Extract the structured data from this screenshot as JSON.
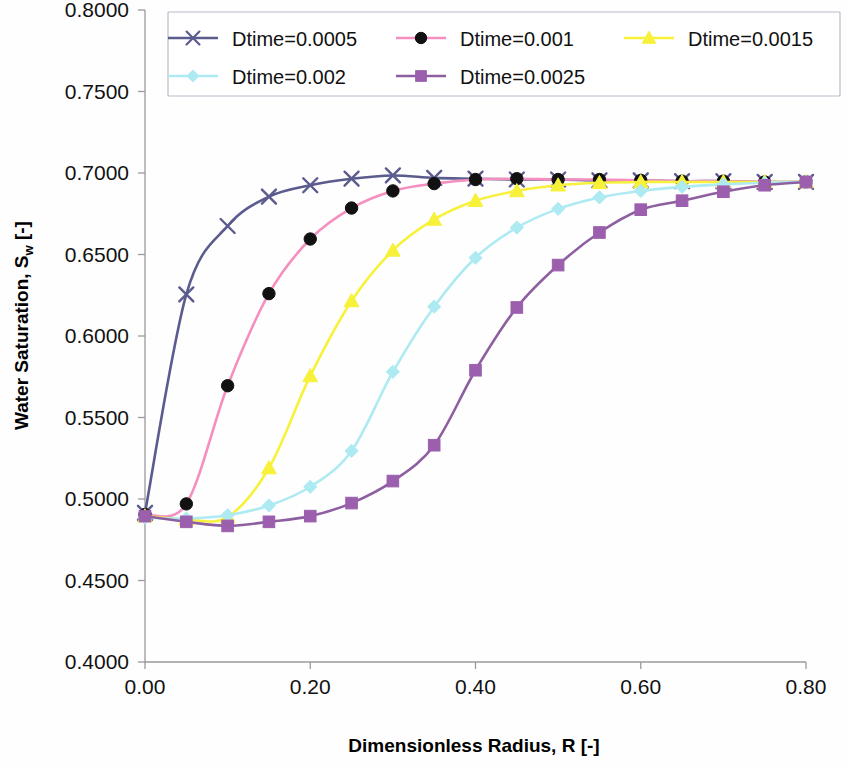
{
  "chart_data": {
    "type": "line",
    "title": "",
    "xlabel": "Dimensionless Radius, R [-]",
    "ylabel_main": "Water Saturation, S",
    "ylabel_sub": "w",
    "ylabel_tail": " [-]",
    "xlim": [
      0.0,
      0.8
    ],
    "ylim": [
      0.4,
      0.8
    ],
    "grid": false,
    "legend_position": "top",
    "xticks": [
      "0.00",
      "0.20",
      "0.40",
      "0.60",
      "0.80"
    ],
    "xtick_values": [
      0.0,
      0.2,
      0.4,
      0.6,
      0.8
    ],
    "yticks": [
      "0.4000",
      "0.4500",
      "0.5000",
      "0.5500",
      "0.6000",
      "0.6500",
      "0.7000",
      "0.7500",
      "0.8000"
    ],
    "ytick_values": [
      0.4,
      0.45,
      0.5,
      0.55,
      0.6,
      0.65,
      0.7,
      0.75,
      0.8
    ],
    "x": [
      0.0,
      0.05,
      0.1,
      0.15,
      0.2,
      0.25,
      0.3,
      0.35,
      0.4,
      0.45,
      0.5,
      0.55,
      0.6,
      0.65,
      0.7,
      0.75,
      0.8
    ],
    "series": [
      {
        "name": "Dtime=0.0005",
        "color": "#5b5b8e",
        "marker": "x",
        "marker_color": "#5b5b8e",
        "values": [
          0.4915,
          0.6255,
          0.6675,
          0.6855,
          0.6925,
          0.6965,
          0.6985,
          0.697,
          0.6965,
          0.696,
          0.696,
          0.6955,
          0.6955,
          0.695,
          0.695,
          0.6945,
          0.6945
        ]
      },
      {
        "name": "Dtime=0.001",
        "color": "#f48fc0",
        "marker": "circle",
        "marker_color": "#111111",
        "values": [
          0.4905,
          0.497,
          0.5695,
          0.626,
          0.6595,
          0.6785,
          0.689,
          0.6935,
          0.696,
          0.6965,
          0.696,
          0.696,
          0.6955,
          0.695,
          0.695,
          0.6945,
          0.6945
        ]
      },
      {
        "name": "Dtime=0.0015",
        "color": "#f8f13a",
        "marker": "triangle",
        "marker_color": "#f8f13a",
        "values": [
          0.4895,
          0.4875,
          0.489,
          0.519,
          0.5755,
          0.6215,
          0.6525,
          0.6715,
          0.683,
          0.689,
          0.6925,
          0.694,
          0.6945,
          0.6945,
          0.6945,
          0.6945,
          0.6945
        ]
      },
      {
        "name": "Dtime=0.002",
        "color": "#aeeaf2",
        "marker": "diamond",
        "marker_color": "#aeeaf2",
        "values": [
          0.4885,
          0.488,
          0.49,
          0.496,
          0.5075,
          0.5295,
          0.578,
          0.618,
          0.648,
          0.6665,
          0.678,
          0.685,
          0.689,
          0.6915,
          0.693,
          0.694,
          0.6945
        ]
      },
      {
        "name": "Dtime=0.0025",
        "color": "#8e5fa0",
        "marker": "square",
        "marker_color": "#9b5fae",
        "values": [
          0.4895,
          0.486,
          0.4835,
          0.486,
          0.4895,
          0.4975,
          0.511,
          0.533,
          0.579,
          0.6175,
          0.6435,
          0.6635,
          0.6775,
          0.683,
          0.6885,
          0.6925,
          0.6945
        ]
      }
    ]
  }
}
